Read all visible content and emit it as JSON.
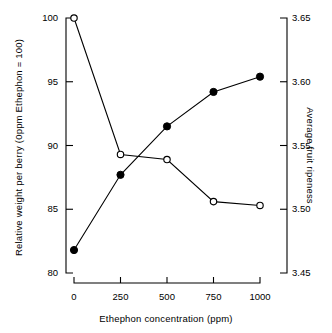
{
  "chart_data": {
    "type": "line",
    "title": "",
    "xlabel": "Ethephon concentration (ppm)",
    "ylabel": "Relative weight per berry  (0ppm Ethephon = 100)",
    "y2label": "Average fruit ripeness",
    "x": [
      0,
      250,
      500,
      750,
      1000
    ],
    "xticklabels": [
      "0",
      "250",
      "500",
      "750",
      "1000"
    ],
    "xlim": [
      -60,
      1060
    ],
    "ylim": [
      80,
      100
    ],
    "yticks": [
      80,
      85,
      90,
      95,
      100
    ],
    "yticklabels": [
      "80",
      "85",
      "90",
      "95",
      "100"
    ],
    "y2lim": [
      3.45,
      3.65
    ],
    "y2ticks": [
      3.45,
      3.5,
      3.55,
      3.6,
      3.65
    ],
    "y2ticklabels": [
      "3.45",
      "3.50",
      "3.55",
      "3.60",
      "3.65"
    ],
    "grid": false,
    "legend": "none",
    "series": [
      {
        "name": "Relative weight per berry",
        "axis": "left",
        "marker": "open-circle",
        "values": [
          100.0,
          89.3,
          88.9,
          85.6,
          85.3
        ]
      },
      {
        "name": "Average fruit ripeness",
        "axis": "right",
        "marker": "filled-circle",
        "values": [
          3.468,
          3.527,
          3.565,
          3.592,
          3.604
        ]
      }
    ],
    "colors": {
      "line": "#000000",
      "marker_fill_open": "#ffffff",
      "marker_fill_closed": "#000000",
      "axis": "#000000",
      "background": "#ffffff"
    }
  }
}
